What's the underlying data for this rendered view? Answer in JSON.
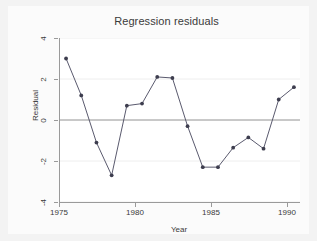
{
  "chart_data": {
    "type": "line",
    "title": "Regression residuals",
    "xlabel": "Year",
    "ylabel": "Residual",
    "x": [
      1975,
      1976,
      1977,
      1978,
      1979,
      1980,
      1981,
      1982,
      1983,
      1984,
      1985,
      1986,
      1987,
      1988,
      1989,
      1990
    ],
    "values": [
      3.0,
      1.2,
      -1.1,
      -2.7,
      0.7,
      0.8,
      2.1,
      2.05,
      -0.3,
      -2.3,
      -2.3,
      -1.35,
      -0.85,
      -1.4,
      1.0,
      1.6
    ],
    "series": [
      {
        "name": "Residual",
        "values": [
          3.0,
          1.2,
          -1.1,
          -2.7,
          0.7,
          0.8,
          2.1,
          2.05,
          -0.3,
          -2.3,
          -2.3,
          -1.35,
          -0.85,
          -1.4,
          1.0,
          1.6
        ]
      }
    ],
    "xlim": [
      1974.6,
      1990.4
    ],
    "ylim": [
      -4,
      4
    ],
    "xticks": [
      1975,
      1980,
      1985,
      1990
    ],
    "xtick_labels": [
      "1975",
      "1980",
      "1985",
      "1990"
    ],
    "yticks": [
      4,
      2,
      0,
      -2,
      -4
    ],
    "ytick_labels": [
      "4",
      "2",
      "0",
      "-2",
      "-4"
    ],
    "grid": "horizontal-light",
    "legend": "none",
    "marker": "filled-circle",
    "reference_line": 0,
    "colors": {
      "line": "#5a5a6e",
      "marker": "#3d3d4e",
      "reference_line": "#9a9a9a",
      "axis": "#9a9a9a",
      "gridline": "#eeeeee",
      "plot_background": "#ffffff",
      "graph_background": "#fbfbfb",
      "page_background": "#f3f3f3",
      "text": "#3a3a3a"
    }
  }
}
